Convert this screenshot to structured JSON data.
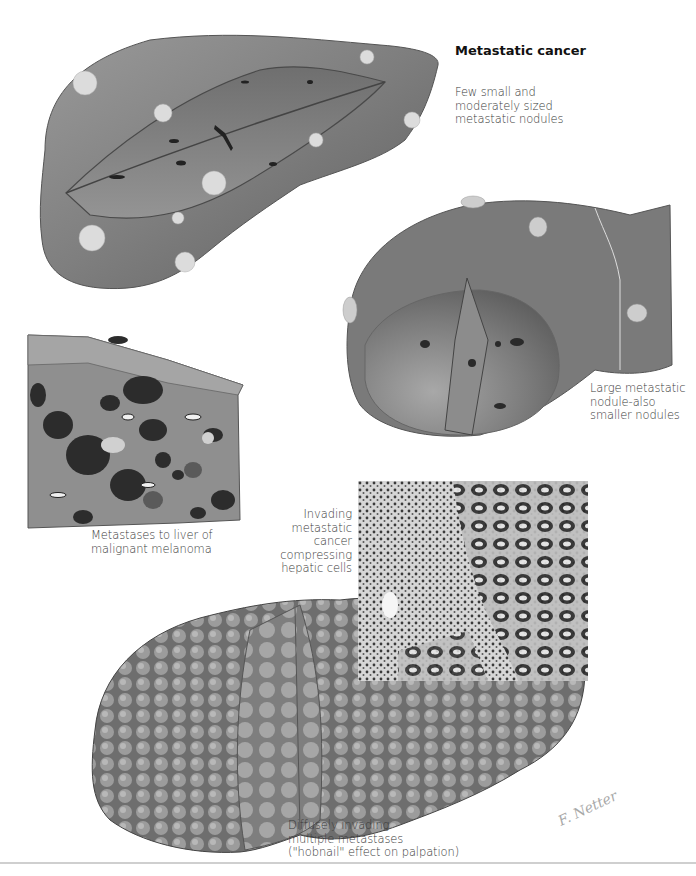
{
  "plate": {
    "title": "Metastatic cancer",
    "signature": "F. Netter",
    "colors": {
      "background": "#ffffff",
      "liver_surface": "#8a8a8a",
      "liver_dark": "#5a5a5a",
      "nodule": "#d8d8d8",
      "melanoma_spot": "#2e2e2e",
      "label_text": "#3a3a3a"
    }
  },
  "illustrations": [
    {
      "id": "liver-few-nodules",
      "caption_lines": [
        "Few small and",
        "moderately sized",
        "metastatic nodules"
      ]
    },
    {
      "id": "liver-large-nodule",
      "caption_lines": [
        "Large metastatic",
        "nodule-also",
        "smaller nodules"
      ]
    },
    {
      "id": "melanoma-section",
      "caption_lines": [
        "Metastases to liver of",
        "malignant melanoma"
      ]
    },
    {
      "id": "micrograph",
      "caption_lines": [
        "Invading",
        "metastatic",
        "cancer",
        "compressing",
        "hepatic cells"
      ]
    },
    {
      "id": "liver-hobnail",
      "caption_lines": [
        "Diffusely invading",
        "multiple metastases",
        "(\"hobnail\" effect on palpation)"
      ]
    }
  ]
}
